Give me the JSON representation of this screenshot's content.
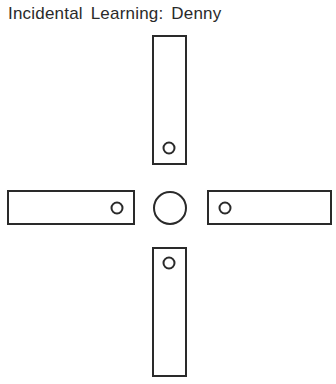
{
  "title": "Incidental Learning: Denny",
  "diagram": {
    "type": "plus-maze",
    "stroke_color": "#2a2a2a",
    "arms": [
      {
        "name": "north-arm",
        "x": 153,
        "y": 36,
        "w": 33,
        "h": 128,
        "goal": {
          "cx": 169,
          "cy": 148,
          "r": 5.5
        }
      },
      {
        "name": "west-arm",
        "x": 8,
        "y": 191,
        "w": 126,
        "h": 33,
        "goal": {
          "cx": 117,
          "cy": 208,
          "r": 5.5
        }
      },
      {
        "name": "east-arm",
        "x": 208,
        "y": 191,
        "w": 123,
        "h": 33,
        "goal": {
          "cx": 225,
          "cy": 208,
          "r": 5.5
        }
      },
      {
        "name": "south-arm",
        "x": 153,
        "y": 248,
        "w": 33,
        "h": 128,
        "goal": {
          "cx": 169,
          "cy": 263,
          "r": 5.5
        }
      }
    ],
    "center": {
      "cx": 170,
      "cy": 208,
      "r": 16
    }
  }
}
